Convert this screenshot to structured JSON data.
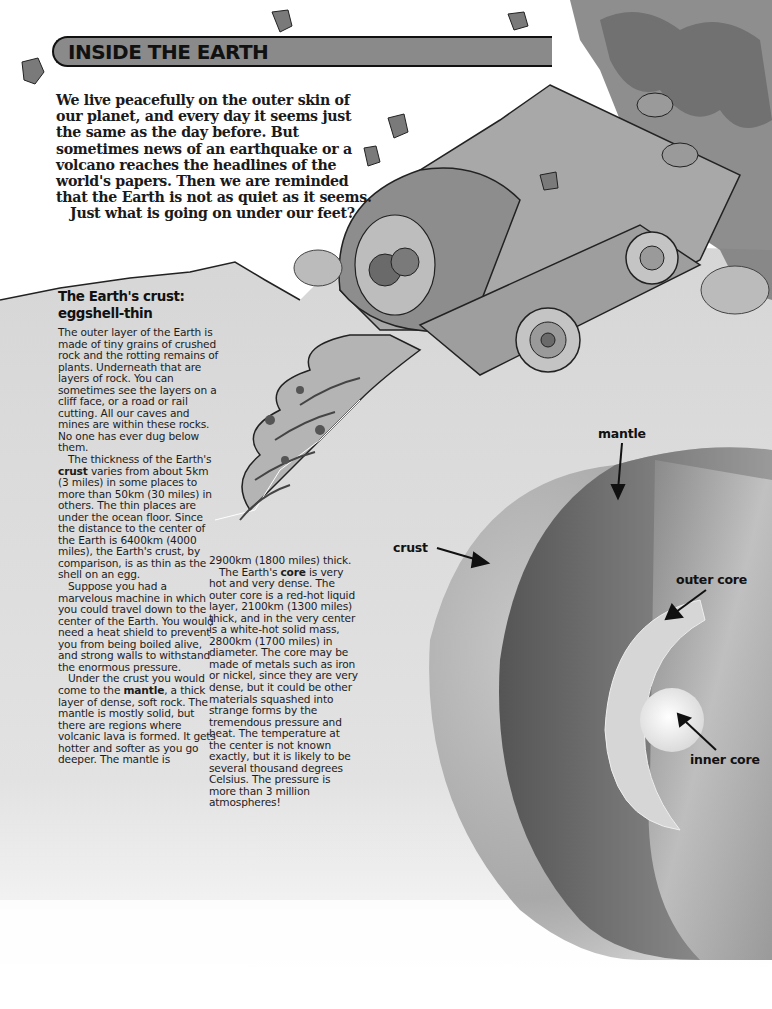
{
  "page": {
    "title": "INSIDE THE EARTH",
    "intro": {
      "lines": [
        "We live peacefully on the outer skin of",
        "our planet, and every day it seems just",
        "the same as the day before. But",
        "sometimes news of an earthquake or a",
        "volcano reaches the headlines of the",
        "world's papers. Then we are reminded",
        "that the Earth is not as quiet as it seems."
      ],
      "closing": "Just what is going on under our feet?"
    },
    "section": {
      "heading_line1": "The Earth's crust:",
      "heading_line2": "eggshell-thin"
    },
    "column1": {
      "p1": "The outer layer of the Earth is made of tiny grains of crushed rock and the rotting remains of plants. Underneath that are layers of rock. You can sometimes see the layers on a cliff face, or a road or rail cutting. All our caves and mines are within these rocks. No one has ever dug below them.",
      "p2_a": "The thickness of the Earth's ",
      "p2_bold": "crust",
      "p2_b": " varies from about 5km (3 miles) in some places to more than 50km (30 miles) in others. The thin places are under the ocean floor. Since the distance to the center of the Earth is 6400km (4000 miles), the Earth's crust, by comparison, is as thin as the shell on an egg.",
      "p3": "Suppose you had a marvelous machine in which you could travel down to the center of the Earth. You would need a heat shield to prevent you from being boiled alive, and strong walls to withstand the enormous pressure.",
      "p4_a": "Under the crust you would come to the ",
      "p4_bold": "mantle",
      "p4_b": ", a thick layer of dense, soft rock. The mantle is mostly solid, but there are regions where volcanic lava is formed. It gets hotter and softer as you go deeper. The mantle is"
    },
    "column2": {
      "p1": "2900km (1800 miles) thick.",
      "p2_a": "The Earth's ",
      "p2_bold": "core",
      "p2_b": " is very hot and very dense. The outer core is a red-hot liquid layer, 2100km (1300 miles) thick, and in the very center is a white-hot solid mass, 2800km (1700 miles) in diameter. The core may be made of metals such as iron or nickel, since they are very dense, but it could be other materials squashed into strange forms by the tremendous pressure and heat. The temperature at the center is not known exactly, but it is likely to be several thousand degrees Celsius. The pressure is more than 3 million atmospheres!"
    },
    "diagram": {
      "labels": {
        "mantle": "mantle",
        "crust": "crust",
        "outer_core": "outer core",
        "inner_core": "inner core"
      }
    },
    "illustration": {
      "subject": "drilling-machine-illustration"
    },
    "colors": {
      "banner": "#8a8a8a",
      "ground": "#d4d4d4",
      "crust": "#bdbdbd",
      "mantle": "#6e6e6e",
      "outer_core": "#d9d9d9",
      "inner_core": "#f2f2f2"
    }
  }
}
